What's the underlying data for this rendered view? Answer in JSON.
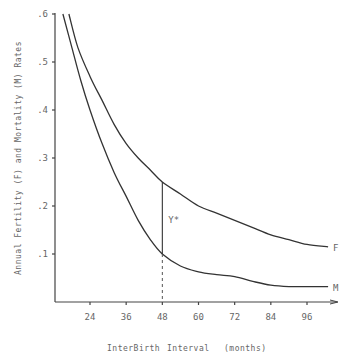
{
  "chart_data": {
    "type": "line",
    "title": "",
    "xlabel": "InterBirth Interval (months)",
    "ylabel": "Annual Fertility (F) and Mortality (M) Rates",
    "x_ticks": [
      24,
      36,
      48,
      60,
      72,
      84,
      96
    ],
    "y_ticks": [
      ".1",
      ".2",
      ".3",
      ".4",
      ".5",
      ".6"
    ],
    "y_tick_values": [
      0.1,
      0.2,
      0.3,
      0.4,
      0.5,
      0.6
    ],
    "xlim": [
      12,
      104
    ],
    "ylim": [
      0,
      0.6
    ],
    "grid": false,
    "series": [
      {
        "name": "F",
        "label": "F",
        "x": [
          17,
          20,
          24,
          28,
          32,
          36,
          40,
          44,
          48,
          54,
          60,
          66,
          72,
          78,
          84,
          90,
          96,
          103
        ],
        "values": [
          0.6,
          0.53,
          0.47,
          0.42,
          0.37,
          0.33,
          0.3,
          0.275,
          0.25,
          0.225,
          0.2,
          0.185,
          0.17,
          0.155,
          0.14,
          0.13,
          0.12,
          0.115
        ]
      },
      {
        "name": "M",
        "label": "M",
        "x": [
          15,
          18,
          21,
          24,
          28,
          32,
          36,
          40,
          44,
          48,
          54,
          60,
          66,
          72,
          78,
          84,
          90,
          96,
          103
        ],
        "values": [
          0.6,
          0.53,
          0.46,
          0.4,
          0.33,
          0.27,
          0.22,
          0.17,
          0.13,
          0.1,
          0.075,
          0.063,
          0.057,
          0.053,
          0.043,
          0.035,
          0.032,
          0.032,
          0.032
        ]
      }
    ],
    "annotations": [
      {
        "text": "Y*",
        "x": 50,
        "y": 0.17,
        "note": "vertical gap between F and M at 48 months"
      },
      {
        "type": "vline",
        "x": 48,
        "style": "dashed below M, solid between M and F"
      }
    ]
  },
  "labels": {
    "xlabel_part1": "InterBirth",
    "xlabel_part2": "Interval",
    "xlabel_part3": "(months)",
    "ylabel": "Annual Fertility (F) and Mortality (M) Rates",
    "ystar": "Y*",
    "f_label": "F",
    "m_label": "M"
  }
}
